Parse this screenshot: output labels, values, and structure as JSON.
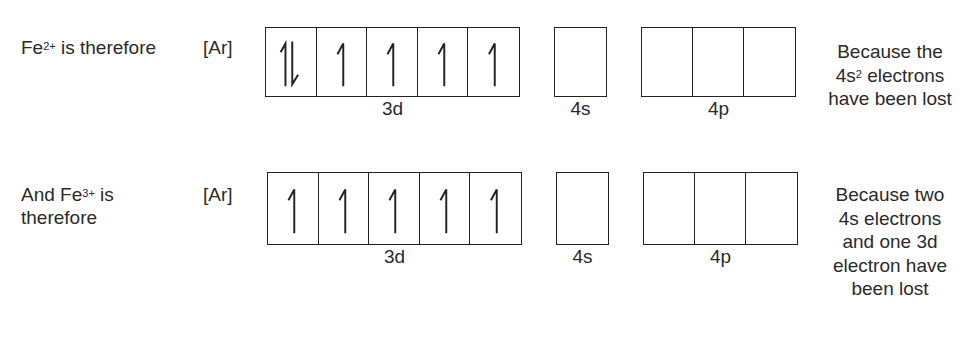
{
  "rows": [
    {
      "ion_label_prefix": "Fe",
      "ion_charge": "2+",
      "ion_label_suffix": " is therefore",
      "core": "[Ar]",
      "orbitals": {
        "3d": {
          "label": "3d",
          "boxes": [
            "up-down",
            "up",
            "up",
            "up",
            "up"
          ]
        },
        "4s": {
          "label": "4s",
          "boxes": [
            "empty"
          ]
        },
        "4p": {
          "label": "4p",
          "boxes": [
            "empty",
            "empty",
            "empty"
          ]
        }
      },
      "explanation_lines": [
        "Because the",
        "4s",
        "2",
        " electrons",
        "have been lost"
      ]
    },
    {
      "ion_label_line1_prefix": "And Fe",
      "ion_charge": "3+",
      "ion_label_line1_suffix": " is",
      "ion_label_line2": "therefore",
      "core": "[Ar]",
      "orbitals": {
        "3d": {
          "label": "3d",
          "boxes": [
            "up",
            "up",
            "up",
            "up",
            "up"
          ]
        },
        "4s": {
          "label": "4s",
          "boxes": [
            "empty"
          ]
        },
        "4p": {
          "label": "4p",
          "boxes": [
            "empty",
            "empty",
            "empty"
          ]
        }
      },
      "explanation_lines": [
        "Because two",
        "4s electrons",
        "and one 3d",
        "electron have",
        "been lost"
      ]
    }
  ],
  "colors": {
    "ink": "#222222",
    "text": "#2a2a2a",
    "background": "#ffffff"
  }
}
